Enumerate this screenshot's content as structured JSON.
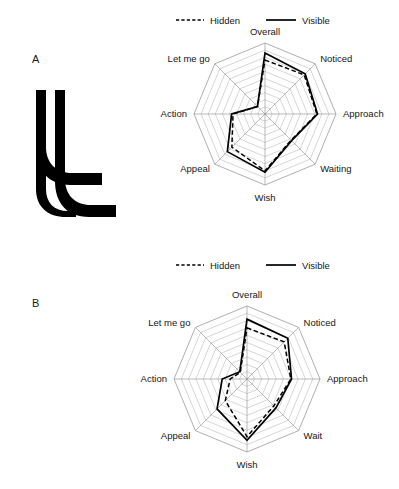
{
  "figure": {
    "background": "#ffffff",
    "ink_color": "#000000",
    "grid_color": "#b3b3b3"
  },
  "panels": [
    {
      "id": "a",
      "letter": "A",
      "stimulus_name": "double-hook-outline-stimulus",
      "legend": {
        "entries": [
          {
            "label": "Hidden",
            "style": "dashed"
          },
          {
            "label": "Visible",
            "style": "solid"
          }
        ]
      },
      "chart_data": {
        "type": "radar",
        "title": "",
        "categories": [
          "Overall",
          "Noticed",
          "Approach",
          "Waiting",
          "Wish",
          "Appeal",
          "Action",
          "Let me go"
        ],
        "series": [
          {
            "name": "Visible",
            "style": "solid",
            "values": [
              8.6,
              8.0,
              7.4,
              5.3,
              8.2,
              7.5,
              4.7,
              1.5
            ]
          },
          {
            "name": "Hidden",
            "style": "dashed",
            "values": [
              7.6,
              7.8,
              7.3,
              5.2,
              8.0,
              6.6,
              4.5,
              1.5
            ]
          }
        ],
        "rings": 10,
        "rlim": [
          0,
          10
        ],
        "grid": true,
        "tick_labels_shown": false,
        "legend_position": "top"
      }
    },
    {
      "id": "b",
      "letter": "B",
      "stimulus_name": "solid-blade-silhouette-stimulus",
      "legend": {
        "entries": [
          {
            "label": "Hidden",
            "style": "dashed"
          },
          {
            "label": "Visible",
            "style": "solid"
          }
        ]
      },
      "chart_data": {
        "type": "radar",
        "title": "",
        "categories": [
          "Overall",
          "Noticed",
          "Approach",
          "Wait",
          "Wish",
          "Appeal",
          "Action",
          "Let me go"
        ],
        "series": [
          {
            "name": "Visible",
            "style": "solid",
            "values": [
              8.2,
              7.9,
              6.1,
              5.6,
              8.4,
              5.8,
              3.4,
              1.4
            ]
          },
          {
            "name": "Hidden",
            "style": "dashed",
            "values": [
              7.0,
              7.2,
              6.0,
              5.2,
              7.9,
              4.2,
              2.3,
              1.3
            ]
          }
        ],
        "rings": 10,
        "rlim": [
          0,
          10
        ],
        "grid": true,
        "tick_labels_shown": false,
        "legend_position": "top"
      }
    }
  ]
}
